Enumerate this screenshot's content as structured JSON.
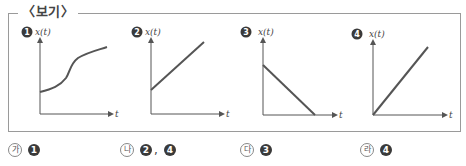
{
  "box": {
    "title": "〈보기〉"
  },
  "graphs": [
    {
      "number": "1",
      "ylabel": "x(t)",
      "xlabel": "t",
      "shape": "s-curve, starting at positive intercept, increasing, flattening"
    },
    {
      "number": "2",
      "ylabel": "x(t)",
      "xlabel": "t",
      "shape": "straight line, positive intercept, positive slope"
    },
    {
      "number": "3",
      "ylabel": "x(t)",
      "xlabel": "t",
      "shape": "straight line, positive intercept, negative slope reaching zero"
    },
    {
      "number": "4",
      "ylabel": "x(t)",
      "xlabel": "t",
      "shape": "straight line from origin, positive slope"
    }
  ],
  "answers": [
    {
      "marker": "가",
      "choices": [
        "1"
      ]
    },
    {
      "marker": "나",
      "choices": [
        "2",
        "4"
      ],
      "separator": ","
    },
    {
      "marker": "다",
      "choices": [
        "3"
      ]
    },
    {
      "marker": "라",
      "choices": [
        "4"
      ]
    }
  ],
  "colors": {
    "axis": "#555555",
    "curve": "#555555",
    "border": "#9a9a9a",
    "badge": "#3a3a3a"
  }
}
